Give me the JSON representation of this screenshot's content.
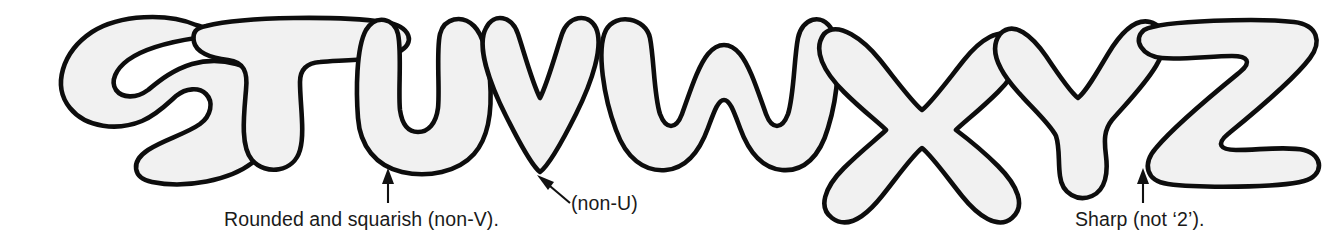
{
  "figure": {
    "kind": "bubble-letter-alphabet-diagram",
    "letters": [
      "S",
      "T",
      "U",
      "V",
      "W",
      "X",
      "Y",
      "Z"
    ],
    "fill_color": "#f1f1f1",
    "outline_color": "#0d0d0d",
    "background_color": "#ffffff",
    "text_color": "#1a1a1a"
  },
  "annotations": [
    {
      "id": "rounded-squarish",
      "text": "Rounded and squarish (non-V).",
      "points_to": "U",
      "arrow": "up"
    },
    {
      "id": "non-u",
      "text": "(non-U)",
      "points_to": "V",
      "arrow": "diagonal-up-left"
    },
    {
      "id": "sharp",
      "text": "Sharp (not ‘2’).",
      "points_to": "Z",
      "arrow": "up"
    }
  ]
}
